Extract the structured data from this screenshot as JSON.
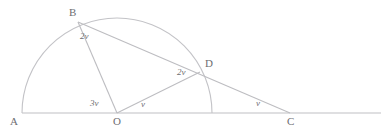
{
  "figure": {
    "kind": "geometry-diagram",
    "width": 387,
    "height": 136,
    "stroke_color": "#b9b9bd",
    "text_color": "#6e6e72",
    "background_color": "#ffffff"
  },
  "points": {
    "A": {
      "label": "A",
      "x": 22,
      "y": 113,
      "label_x": 10,
      "label_y": 116
    },
    "B": {
      "label": "B",
      "x": 78,
      "y": 22,
      "label_x": 69,
      "label_y": 7
    },
    "C": {
      "label": "C",
      "x": 290,
      "y": 113,
      "label_x": 287,
      "label_y": 116
    },
    "D": {
      "label": "D",
      "x": 200,
      "y": 72,
      "label_x": 205,
      "label_y": 58
    },
    "O": {
      "label": "O",
      "x": 117,
      "y": 113,
      "label_x": 113,
      "label_y": 116
    }
  },
  "angles": [
    {
      "id": "angle-at-B",
      "label": "2v",
      "x": 80,
      "y": 32
    },
    {
      "id": "angle-at-D",
      "label": "2v",
      "x": 177,
      "y": 68
    },
    {
      "id": "angle-BOA",
      "label": "3v",
      "x": 90,
      "y": 99
    },
    {
      "id": "angle-DOC",
      "label": "v",
      "x": 141,
      "y": 100
    },
    {
      "id": "angle-at-C",
      "label": "v",
      "x": 256,
      "y": 99
    }
  ],
  "circle": {
    "center_x": 117,
    "center_y": 113,
    "radius": 95,
    "arc_description": "semicircular arc from A on the left, over the top through B, down through D to the baseline on the right"
  },
  "segments": [
    {
      "id": "baseline-AC",
      "from": "A",
      "to": "line-right-end",
      "description": "horizontal base line through A, O and C extending to the right edge"
    },
    {
      "id": "segment-BO",
      "from": "B",
      "to": "O",
      "description": "radius from B to centre O"
    },
    {
      "id": "segment-OD",
      "from": "O",
      "to": "D",
      "description": "radius from O to D"
    },
    {
      "id": "segment-BC",
      "from": "B",
      "to": "C",
      "description": "secant from B through D to C"
    }
  ]
}
